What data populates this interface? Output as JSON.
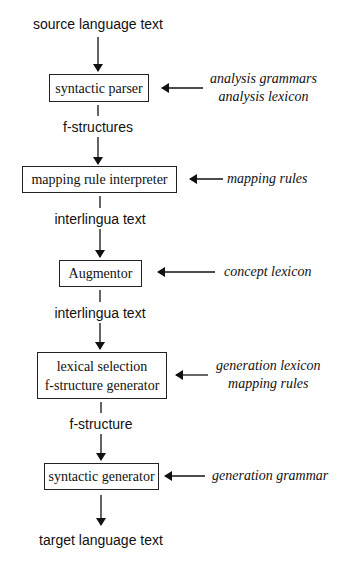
{
  "diagram": {
    "input": "source language text",
    "output": "target language text",
    "stages": [
      {
        "lines": [
          "syntactic parser"
        ],
        "resources": [
          "analysis grammars",
          "analysis lexicon"
        ]
      },
      {
        "lines": [
          "mapping rule interpreter"
        ],
        "resources": [
          "mapping rules"
        ]
      },
      {
        "lines": [
          "Augmentor"
        ],
        "resources": [
          "concept lexicon"
        ]
      },
      {
        "lines": [
          "lexical selection",
          "f-structure generator"
        ],
        "resources": [
          "generation lexicon",
          "mapping rules"
        ]
      },
      {
        "lines": [
          "syntactic generator"
        ],
        "resources": [
          "generation grammar"
        ]
      }
    ],
    "intermediates": [
      "f-structures",
      "interlingua text",
      "interlingua text",
      "f-structure"
    ]
  }
}
